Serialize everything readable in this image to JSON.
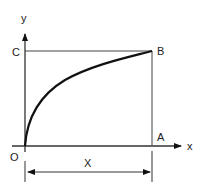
{
  "diagram": {
    "labels": {
      "y_axis": "y",
      "x_axis": "x",
      "origin": "O",
      "point_a": "A",
      "point_b": "B",
      "point_c": "C",
      "dimension": "X"
    },
    "colors": {
      "line": "#333333",
      "curve": "#111111",
      "background": "#ffffff"
    }
  }
}
